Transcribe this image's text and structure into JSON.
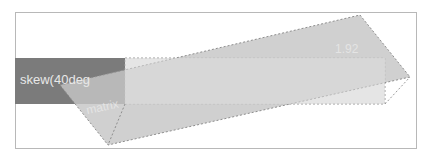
{
  "diagram": {
    "box_label": "skew(40deg",
    "ghost_labels": {
      "upper_right": "1.92",
      "lower_left": "matrix"
    },
    "colors": {
      "frame_border": "#b8b8b8",
      "original_box_fill": "#7b7b7b",
      "original_outline_fill": "#e2e2e2",
      "skewed_fill": "#c9c9c9",
      "dashed_stroke": "#9a9a9a",
      "label_color": "#e8e8e8"
    },
    "shapes": {
      "frame": {
        "x": 15,
        "y": 12,
        "w": 402,
        "h": 137
      },
      "original_box": {
        "x": 15,
        "y": 58,
        "w": 110,
        "h": 46
      },
      "original_outline": {
        "x": 125,
        "y": 58,
        "w": 260,
        "h": 46
      },
      "skewed_parallelogram": [
        [
          60,
          85
        ],
        [
          360,
          15
        ],
        [
          410,
          77
        ],
        [
          108,
          145
        ]
      ]
    }
  }
}
